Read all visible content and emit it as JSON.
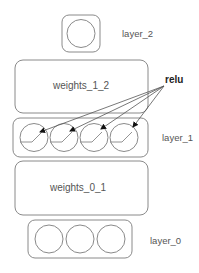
{
  "diagram": {
    "layers": [
      {
        "id": "layer_2",
        "label": "layer_2",
        "neurons": 1
      },
      {
        "id": "weights_1_2",
        "label": "weights_1_2"
      },
      {
        "id": "layer_1",
        "label": "layer_1",
        "neurons": 4,
        "activation": "relu"
      },
      {
        "id": "weights_0_1",
        "label": "weights_0_1"
      },
      {
        "id": "layer_0",
        "label": "layer_0",
        "neurons": 3
      }
    ],
    "annotation": {
      "label": "relu",
      "targets": "layer_1 neurons"
    },
    "colors": {
      "stroke": "#8a8a8a",
      "text": "#555555",
      "annotation": "#222222"
    }
  }
}
